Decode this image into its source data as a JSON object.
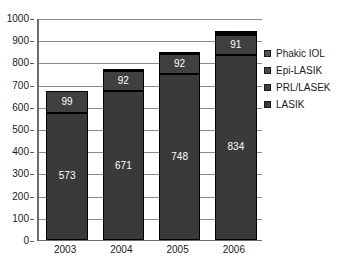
{
  "chart_data": {
    "type": "bar",
    "stacked": true,
    "title": "",
    "subtitle": "",
    "xlabel": "",
    "ylabel": "",
    "categories": [
      "2003",
      "2004",
      "2005",
      "2006"
    ],
    "ylim": [
      0,
      1000
    ],
    "y_ticks": [
      0,
      100,
      200,
      300,
      400,
      500,
      600,
      700,
      800,
      900,
      1000
    ],
    "y_tick_labels": [
      "0",
      "100",
      "200",
      "300",
      "400",
      "500",
      "600",
      "700",
      "800",
      "900",
      "1000"
    ],
    "grid": true,
    "grid_axis": "y",
    "legend_position": "right",
    "series": [
      {
        "name": "LASIK",
        "color": "#3a3a3a",
        "values": [
          573,
          671,
          748,
          834
        ],
        "labels": [
          "573",
          "671",
          "748",
          "834"
        ]
      },
      {
        "name": "PRL/LASEK",
        "color": "#404040",
        "values": [
          99,
          92,
          92,
          91
        ],
        "labels": [
          "99",
          "92",
          "92",
          "91"
        ]
      },
      {
        "name": "Epi-LASIK",
        "color": "#4a4a4a",
        "values": [
          0,
          9,
          4,
          9
        ],
        "labels": [
          "",
          "9",
          "4",
          "9"
        ]
      },
      {
        "name": "Phakic IOL",
        "color": "#545454",
        "values": [
          0,
          0,
          0,
          8
        ],
        "labels": [
          "",
          "",
          "",
          "8"
        ]
      }
    ],
    "totals": [
      672,
      772,
      844,
      942
    ]
  },
  "legend": {
    "items": [
      {
        "label": "Phakic IOL",
        "color": "#545454"
      },
      {
        "label": "Epi-LASIK",
        "color": "#4a4a4a"
      },
      {
        "label": "PRL/LASEK",
        "color": "#404040"
      },
      {
        "label": "LASIK",
        "color": "#3a3a3a"
      }
    ]
  },
  "axis_colors": {
    "axis_line": "#6b6b6b",
    "gridline": "#8c8c8c",
    "text": "#1a1a1a",
    "bar_outline": "#000000",
    "label_text": "#ffffff"
  }
}
